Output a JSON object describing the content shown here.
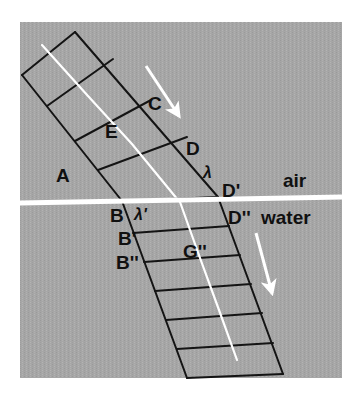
{
  "figure": {
    "panel": {
      "background_color": "#a8a8a8",
      "page_color": "#ffffff",
      "x": 20,
      "y": 22,
      "width": 322,
      "height": 356
    },
    "interface": {
      "label_upper": "air",
      "label_lower": "water",
      "color": "#ffffff",
      "x1": 20,
      "y1": 203,
      "x2": 342,
      "y2": 197
    },
    "media_labels": [
      {
        "name": "air-label",
        "text": "air",
        "x": 283,
        "y": 187
      },
      {
        "name": "water-label",
        "text": "water",
        "x": 262,
        "y": 223
      }
    ],
    "point_labels": [
      {
        "name": "label-A",
        "text": "A",
        "x": 56,
        "y": 182
      },
      {
        "name": "label-E",
        "text": "E",
        "x": 105,
        "y": 138
      },
      {
        "name": "label-C",
        "text": "C",
        "x": 148,
        "y": 110
      },
      {
        "name": "label-D",
        "text": "D",
        "x": 186,
        "y": 155
      },
      {
        "name": "label-lambda",
        "text": "λ",
        "x": 203,
        "y": 178
      },
      {
        "name": "label-Dprime",
        "text": "D'",
        "x": 222,
        "y": 197
      },
      {
        "name": "label-B",
        "text": "B",
        "x": 112,
        "y": 221
      },
      {
        "name": "label-lambdapr",
        "text": "λ'",
        "x": 135,
        "y": 219
      },
      {
        "name": "label-Bprime",
        "text": "B'",
        "x": 120,
        "y": 244
      },
      {
        "name": "label-Bdprime",
        "text": "B''",
        "x": 120,
        "y": 268
      },
      {
        "name": "label-Ddprime",
        "text": "D''",
        "x": 228,
        "y": 223
      },
      {
        "name": "label-Gdprime",
        "text": "G''",
        "x": 185,
        "y": 257
      }
    ],
    "incident_beam": {
      "name": "incident-beam",
      "medium": "air",
      "wavelength_symbol": "λ",
      "left_edge": {
        "x1": 22,
        "y1": 75,
        "x2": 122,
        "y2": 201
      },
      "right_edge": {
        "x1": 75,
        "y1": 32,
        "x2": 218,
        "y2": 197
      },
      "wavefront_count": 4,
      "wavefronts": [
        {
          "x1": 22,
          "y1": 75,
          "x2": 75,
          "y2": 32
        },
        {
          "x1": 47,
          "y1": 106,
          "x2": 113,
          "y2": 59
        },
        {
          "x1": 75,
          "y1": 141,
          "x2": 151,
          "y2": 100
        },
        {
          "x1": 98,
          "y1": 170,
          "x2": 187,
          "y2": 137
        },
        {
          "x1": 122,
          "y1": 201,
          "x2": 218,
          "y2": 197
        }
      ],
      "ray": {
        "x1": 42,
        "y1": 45,
        "x2": 178,
        "y2": 200
      },
      "ray_color": "#ffffff"
    },
    "refracted_beam": {
      "name": "refracted-beam",
      "medium": "water",
      "wavelength_symbol": "λ'",
      "left_edge": {
        "x1": 122,
        "y1": 201,
        "x2": 187,
        "y2": 378
      },
      "right_edge": {
        "x1": 218,
        "y1": 197,
        "x2": 283,
        "y2": 374
      },
      "wavefront_count": 7,
      "wavefronts": [
        {
          "x1": 122,
          "y1": 201,
          "x2": 218,
          "y2": 197
        },
        {
          "x1": 133,
          "y1": 233,
          "x2": 229,
          "y2": 226
        },
        {
          "x1": 144,
          "y1": 262,
          "x2": 240,
          "y2": 255
        },
        {
          "x1": 155,
          "y1": 291,
          "x2": 251,
          "y2": 284
        },
        {
          "x1": 166,
          "y1": 320,
          "x2": 262,
          "y2": 313
        },
        {
          "x1": 177,
          "y1": 349,
          "x2": 273,
          "y2": 343
        },
        {
          "x1": 187,
          "y1": 378,
          "x2": 283,
          "y2": 374
        }
      ],
      "ray": {
        "x1": 180,
        "y1": 202,
        "x2": 237,
        "y2": 360
      },
      "ray_color": "#ffffff"
    },
    "direction_arrows": [
      {
        "name": "incident-direction-arrow",
        "medium": "air",
        "color": "#ffffff",
        "x1": 146,
        "y1": 66,
        "x2": 181,
        "y2": 119
      },
      {
        "name": "refracted-direction-arrow",
        "medium": "water",
        "color": "#ffffff",
        "x1": 256,
        "y1": 233,
        "x2": 273,
        "y2": 297
      }
    ],
    "line_color": "#141414",
    "line_width": 2
  }
}
